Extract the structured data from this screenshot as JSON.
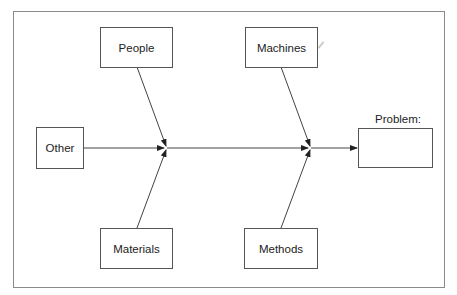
{
  "diagram": {
    "type": "fishbone",
    "causes": {
      "people": "People",
      "machines": "Machines",
      "materials": "Materials",
      "methods": "Methods",
      "other": "Other"
    },
    "effect": {
      "label": "Problem:",
      "value": ""
    },
    "colors": {
      "line": "#333333",
      "box_border": "#555555",
      "frame": "#8a8a8a",
      "text": "#222222"
    }
  }
}
